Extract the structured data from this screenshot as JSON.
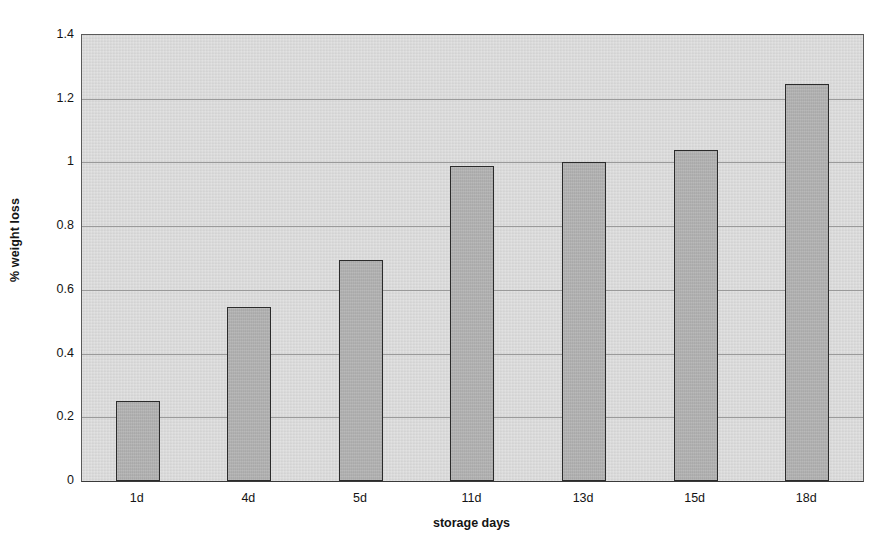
{
  "chart_data": {
    "type": "bar",
    "title": "",
    "subtitle": "",
    "categories": [
      "1d",
      "4d",
      "5d",
      "11d",
      "13d",
      "15d",
      "18d"
    ],
    "values": [
      0.25,
      0.545,
      0.695,
      0.99,
      1.0,
      1.04,
      1.245
    ],
    "xlabel": "storage days",
    "ylabel": "% weight loss",
    "ylim": [
      0,
      1.4
    ],
    "yticks": [
      0,
      0.2,
      0.4,
      0.6,
      0.8,
      1,
      1.2,
      1.4
    ],
    "ytick_labels": [
      "0",
      "0.2",
      "0.4",
      "0.6",
      "0.8",
      "1",
      "1.2",
      "1.4"
    ],
    "grid": "horizontal",
    "legend": "none",
    "annotations": [],
    "colors": {
      "bar_fill": "#ababab",
      "bar_border": "#2b2b2b",
      "plot_background": "#d6d6d6",
      "gridline": "#9a9a9a",
      "axis_line": "#3a3a3a",
      "text": "#141414",
      "figure_background": "#ffffff"
    }
  }
}
